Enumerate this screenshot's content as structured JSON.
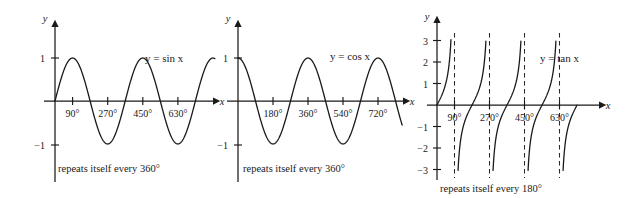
{
  "figure": {
    "panel_count": 3
  },
  "chart_data": [
    {
      "type": "line",
      "id": "sine",
      "title": "",
      "equation_label": "y = sin x",
      "function": "sin",
      "xlabel": "x",
      "ylabel": "y",
      "xlim": [
        -20,
        740
      ],
      "ylim": [
        -1.45,
        1.45
      ],
      "x_ticks": [
        90,
        270,
        450,
        630
      ],
      "x_tick_labels": [
        "90°",
        "270°",
        "450°",
        "630°"
      ],
      "y_ticks": [
        1,
        -1
      ],
      "y_tick_labels": [
        "1",
        "−1"
      ],
      "grid": false,
      "caption": "repeats itself every 360°",
      "period_degrees": 360,
      "amplitude": 1,
      "x": [
        0,
        30,
        60,
        90,
        120,
        150,
        180,
        210,
        240,
        270,
        300,
        330,
        360,
        390,
        420,
        450,
        480,
        510,
        540,
        570,
        600,
        630,
        660,
        690,
        720
      ],
      "values": [
        0,
        0.5,
        0.866,
        1,
        0.866,
        0.5,
        0,
        -0.5,
        -0.866,
        -1,
        -0.866,
        -0.5,
        0,
        0.5,
        0.866,
        1,
        0.866,
        0.5,
        0,
        -0.5,
        -0.866,
        -1,
        -0.866,
        -0.5,
        0
      ]
    },
    {
      "type": "line",
      "id": "cosine",
      "title": "",
      "equation_label": "y = cos x",
      "function": "cos",
      "xlabel": "x",
      "ylabel": "y",
      "xlim": [
        -20,
        780
      ],
      "ylim": [
        -1.45,
        1.45
      ],
      "x_ticks": [
        180,
        360,
        540,
        720
      ],
      "x_tick_labels": [
        "180°",
        "360°",
        "540°",
        "720°"
      ],
      "y_ticks": [
        1,
        -1
      ],
      "y_tick_labels": [
        "1",
        "−1"
      ],
      "grid": false,
      "caption": "repeats itself every 360°",
      "period_degrees": 360,
      "amplitude": 1,
      "x": [
        0,
        30,
        60,
        90,
        120,
        150,
        180,
        210,
        240,
        270,
        300,
        330,
        360,
        390,
        420,
        450,
        480,
        510,
        540,
        570,
        600,
        630,
        660,
        690,
        720,
        750,
        780
      ],
      "values": [
        1,
        0.866,
        0.5,
        0,
        -0.5,
        -0.866,
        -1,
        -0.866,
        -0.5,
        0,
        0.5,
        0.866,
        1,
        0.866,
        0.5,
        0,
        -0.5,
        -0.866,
        -1,
        -0.866,
        -0.5,
        0,
        0.5,
        0.866,
        1,
        0.966,
        0.866
      ]
    },
    {
      "type": "line",
      "id": "tangent",
      "title": "",
      "equation_label": "y = tan x",
      "function": "tan",
      "xlabel": "x",
      "ylabel": "y",
      "xlim": [
        -20,
        740
      ],
      "ylim": [
        -3.4,
        3.4
      ],
      "x_ticks": [
        90,
        270,
        450,
        630
      ],
      "x_tick_labels": [
        "90°",
        "270°",
        "450°",
        "630°"
      ],
      "y_ticks": [
        3,
        2,
        1,
        -1,
        -2,
        -3
      ],
      "y_tick_labels": [
        "3",
        "2",
        "1",
        "−1",
        "−2",
        "−3"
      ],
      "grid": false,
      "caption": "repeats itself every 180°",
      "period_degrees": 180,
      "asymptotes": [
        90,
        270,
        450,
        630
      ],
      "asymptote_style": "dashed",
      "branches": [
        {
          "from": 0,
          "to": 90
        },
        {
          "from": 90,
          "to": 270
        },
        {
          "from": 270,
          "to": 450
        },
        {
          "from": 450,
          "to": 630
        },
        {
          "from": 630,
          "to": 720
        }
      ]
    }
  ]
}
